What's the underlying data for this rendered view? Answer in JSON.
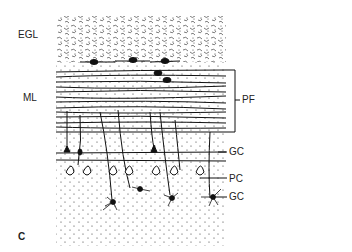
{
  "figure": {
    "panel_letter": "C",
    "left_labels": {
      "egl": "EGL",
      "ml": "ML"
    },
    "right_labels": {
      "pf": "PF",
      "gc_upper": "GC",
      "pc": "PC",
      "gc_lower": "GC"
    },
    "colors": {
      "ink": "#1a1a1a",
      "background": "#ffffff"
    }
  }
}
